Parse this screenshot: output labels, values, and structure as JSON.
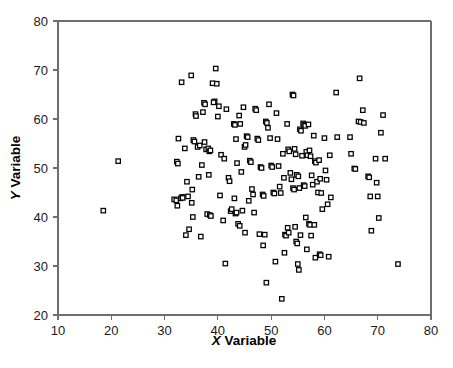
{
  "figure": {
    "background_color": "#ffffff",
    "frame_color": "#6e6e6e",
    "marker_color": "#000000",
    "marker_fill": "#ffffff"
  },
  "axes": {
    "x_title_prefix": "X",
    "x_title_suffix": " Variable",
    "y_title_prefix": "Y",
    "y_title_suffix": " Variable",
    "x_ticks": [
      "10",
      "20",
      "30",
      "40",
      "50",
      "60",
      "70",
      "80"
    ],
    "y_ticks": [
      "20",
      "30",
      "40",
      "50",
      "60",
      "70",
      "80"
    ]
  },
  "chart_data": {
    "type": "scatter",
    "title": "",
    "xlabel": "X Variable",
    "ylabel": "Y Variable",
    "xlim": [
      10,
      80
    ],
    "ylim": [
      20,
      80
    ],
    "xticks": [
      10,
      20,
      30,
      40,
      50,
      60,
      70,
      80
    ],
    "yticks": [
      20,
      30,
      40,
      50,
      60,
      70,
      80
    ],
    "grid": false,
    "legend": null,
    "marker": "open-square",
    "n_points": 196,
    "series": [
      {
        "name": "observations",
        "points": [
          [
            18.5,
            41.3
          ],
          [
            21.3,
            51.4
          ],
          [
            31.8,
            43.6
          ],
          [
            32.2,
            43.4
          ],
          [
            32.4,
            42.3
          ],
          [
            32.3,
            51.3
          ],
          [
            32.5,
            50.9
          ],
          [
            33.0,
            43.8
          ],
          [
            33.3,
            44.1
          ],
          [
            33.4,
            43.9
          ],
          [
            32.6,
            56.0
          ],
          [
            33.2,
            67.5
          ],
          [
            33.8,
            54.0
          ],
          [
            34.2,
            47.2
          ],
          [
            34.4,
            44.2
          ],
          [
            34.0,
            36.3
          ],
          [
            34.6,
            37.5
          ],
          [
            35.0,
            68.9
          ],
          [
            35.4,
            55.7
          ],
          [
            35.6,
            55.4
          ],
          [
            35.2,
            45.6
          ],
          [
            35.1,
            42.9
          ],
          [
            35.3,
            40.0
          ],
          [
            35.8,
            61.0
          ],
          [
            35.9,
            60.6
          ],
          [
            36.2,
            54.3
          ],
          [
            36.6,
            54.6
          ],
          [
            36.4,
            48.2
          ],
          [
            36.8,
            36.0
          ],
          [
            37.4,
            63.3
          ],
          [
            37.6,
            63.0
          ],
          [
            37.2,
            61.4
          ],
          [
            37.5,
            55.3
          ],
          [
            37.0,
            50.6
          ],
          [
            37.8,
            53.8
          ],
          [
            38.2,
            54.0
          ],
          [
            38.4,
            53.4
          ],
          [
            38.6,
            53.6
          ],
          [
            38.3,
            48.6
          ],
          [
            38.0,
            40.6
          ],
          [
            38.5,
            40.4
          ],
          [
            38.7,
            40.2
          ],
          [
            39.0,
            67.3
          ],
          [
            39.4,
            63.6
          ],
          [
            39.2,
            63.4
          ],
          [
            39.6,
            70.3
          ],
          [
            39.8,
            67.2
          ],
          [
            40.2,
            62.6
          ],
          [
            40.0,
            60.5
          ],
          [
            40.6,
            52.7
          ],
          [
            40.4,
            44.4
          ],
          [
            41.0,
            39.3
          ],
          [
            41.4,
            30.5
          ],
          [
            41.6,
            62.0
          ],
          [
            41.2,
            51.9
          ],
          [
            42.0,
            48.0
          ],
          [
            42.2,
            47.3
          ],
          [
            42.4,
            41.2
          ],
          [
            42.6,
            41.6
          ],
          [
            43.0,
            59.0
          ],
          [
            43.2,
            58.8
          ],
          [
            43.4,
            55.9
          ],
          [
            43.6,
            51.0
          ],
          [
            43.1,
            43.8
          ],
          [
            43.3,
            40.7
          ],
          [
            43.5,
            40.9
          ],
          [
            43.8,
            38.6
          ],
          [
            44.0,
            60.7
          ],
          [
            44.2,
            59.0
          ],
          [
            44.4,
            49.2
          ],
          [
            44.6,
            41.3
          ],
          [
            44.1,
            38.2
          ],
          [
            44.8,
            62.4
          ],
          [
            45.0,
            54.3
          ],
          [
            45.2,
            54.7
          ],
          [
            45.4,
            56.5
          ],
          [
            45.6,
            56.3
          ],
          [
            45.8,
            43.3
          ],
          [
            45.1,
            36.8
          ],
          [
            46.0,
            51.5
          ],
          [
            46.2,
            51.2
          ],
          [
            46.4,
            45.7
          ],
          [
            46.6,
            44.6
          ],
          [
            46.8,
            40.9
          ],
          [
            47.0,
            62.1
          ],
          [
            47.2,
            61.8
          ],
          [
            47.4,
            56.0
          ],
          [
            47.6,
            55.7
          ],
          [
            47.8,
            36.5
          ],
          [
            48.0,
            50.2
          ],
          [
            48.2,
            50.0
          ],
          [
            48.4,
            44.6
          ],
          [
            48.6,
            44.3
          ],
          [
            48.8,
            36.4
          ],
          [
            48.5,
            34.2
          ],
          [
            49.0,
            59.5
          ],
          [
            49.2,
            59.2
          ],
          [
            49.4,
            58.2
          ],
          [
            49.6,
            63.0
          ],
          [
            49.8,
            56.1
          ],
          [
            49.1,
            26.6
          ],
          [
            50.0,
            50.5
          ],
          [
            50.2,
            50.2
          ],
          [
            50.4,
            45.0
          ],
          [
            50.6,
            44.8
          ],
          [
            50.8,
            30.9
          ],
          [
            51.0,
            61.2
          ],
          [
            51.2,
            55.9
          ],
          [
            51.4,
            50.4
          ],
          [
            51.6,
            46.2
          ],
          [
            51.8,
            44.9
          ],
          [
            52.0,
            23.3
          ],
          [
            52.2,
            52.9
          ],
          [
            52.4,
            48.0
          ],
          [
            52.6,
            36.4
          ],
          [
            52.8,
            36.2
          ],
          [
            52.5,
            32.7
          ],
          [
            53.0,
            59.0
          ],
          [
            53.2,
            53.8
          ],
          [
            53.4,
            53.4
          ],
          [
            53.6,
            49.0
          ],
          [
            53.8,
            47.7
          ],
          [
            53.1,
            37.8
          ],
          [
            53.3,
            36.8
          ],
          [
            54.0,
            65.0
          ],
          [
            54.2,
            64.8
          ],
          [
            54.4,
            53.9
          ],
          [
            54.6,
            52.8
          ],
          [
            54.8,
            48.6
          ],
          [
            54.1,
            45.9
          ],
          [
            54.3,
            45.6
          ],
          [
            54.5,
            38.0
          ],
          [
            54.7,
            35.0
          ],
          [
            54.9,
            34.6
          ],
          [
            55.0,
            30.4
          ],
          [
            55.2,
            29.2
          ],
          [
            55.4,
            57.9
          ],
          [
            55.6,
            57.6
          ],
          [
            55.8,
            52.5
          ],
          [
            55.1,
            48.3
          ],
          [
            55.3,
            45.9
          ],
          [
            55.5,
            36.3
          ],
          [
            56.0,
            59.1
          ],
          [
            56.2,
            58.8
          ],
          [
            56.4,
            58.6
          ],
          [
            56.6,
            53.3
          ],
          [
            56.8,
            52.6
          ],
          [
            56.1,
            46.5
          ],
          [
            56.3,
            46.3
          ],
          [
            56.5,
            39.9
          ],
          [
            56.7,
            33.4
          ],
          [
            57.0,
            58.9
          ],
          [
            57.2,
            53.6
          ],
          [
            57.4,
            52.4
          ],
          [
            57.6,
            48.5
          ],
          [
            57.8,
            46.6
          ],
          [
            57.1,
            38.6
          ],
          [
            57.3,
            38.4
          ],
          [
            57.5,
            36.2
          ],
          [
            58.0,
            56.6
          ],
          [
            58.2,
            51.4
          ],
          [
            58.4,
            51.1
          ],
          [
            58.6,
            47.2
          ],
          [
            58.8,
            45.0
          ],
          [
            58.1,
            38.4
          ],
          [
            58.3,
            31.7
          ],
          [
            59.0,
            51.6
          ],
          [
            59.2,
            47.8
          ],
          [
            59.4,
            44.9
          ],
          [
            59.6,
            41.6
          ],
          [
            59.1,
            32.4
          ],
          [
            59.3,
            32.2
          ],
          [
            60.0,
            56.1
          ],
          [
            60.2,
            49.5
          ],
          [
            60.4,
            47.6
          ],
          [
            60.6,
            42.6
          ],
          [
            60.8,
            31.9
          ],
          [
            61.0,
            52.6
          ],
          [
            61.2,
            44.0
          ],
          [
            62.2,
            65.4
          ],
          [
            62.4,
            56.3
          ],
          [
            64.8,
            56.3
          ],
          [
            65.0,
            52.9
          ],
          [
            65.6,
            49.9
          ],
          [
            65.8,
            49.8
          ],
          [
            66.4,
            59.5
          ],
          [
            66.6,
            68.3
          ],
          [
            66.8,
            59.4
          ],
          [
            67.2,
            61.8
          ],
          [
            67.4,
            59.2
          ],
          [
            68.2,
            48.3
          ],
          [
            68.4,
            48.1
          ],
          [
            68.6,
            44.2
          ],
          [
            68.8,
            37.2
          ],
          [
            69.6,
            51.9
          ],
          [
            69.8,
            47.0
          ],
          [
            70.0,
            44.2
          ],
          [
            70.2,
            39.8
          ],
          [
            70.6,
            57.2
          ],
          [
            71.0,
            60.8
          ],
          [
            71.4,
            51.9
          ],
          [
            73.8,
            30.4
          ]
        ]
      }
    ]
  }
}
